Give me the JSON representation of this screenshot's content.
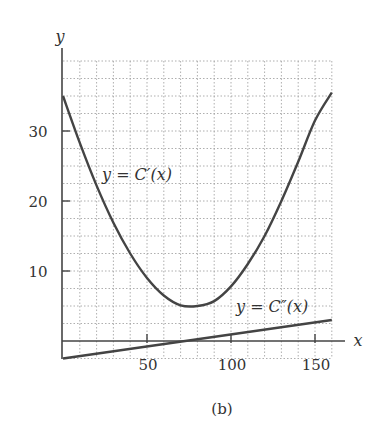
{
  "chart_data": {
    "type": "line",
    "title": "",
    "caption": "(b)",
    "xlabel": "x",
    "ylabel": "y",
    "xlim": [
      0,
      160
    ],
    "ylim": [
      -2.5,
      40
    ],
    "x_ticks": [
      50,
      100,
      150
    ],
    "y_ticks": [
      10,
      20,
      30
    ],
    "grid": {
      "on": true,
      "style": "dotted",
      "x_step": 10,
      "y_step": 2.5
    },
    "series": [
      {
        "name": "C'(x)",
        "label": "y = C′(x)",
        "x": [
          0,
          10,
          20,
          30,
          40,
          50,
          60,
          70,
          80,
          90,
          100,
          110,
          120,
          130,
          140,
          150,
          160
        ],
        "values": [
          35,
          28.3,
          22.2,
          16.9,
          12.5,
          9.0,
          6.5,
          5.1,
          5.0,
          5.7,
          7.8,
          11.0,
          15.0,
          20.0,
          25.6,
          31.5,
          35.5
        ]
      },
      {
        "name": "C''(x)",
        "label": "y = C″(x)",
        "x": [
          0,
          160
        ],
        "values": [
          -2.5,
          3.0
        ]
      }
    ],
    "annotations": [
      {
        "text": "y = C′(x)",
        "x": 35,
        "y": 24
      },
      {
        "text": "y = C″(x)",
        "x": 125,
        "y": 5
      }
    ]
  },
  "labels": {
    "x_axis": "x",
    "y_axis": "y",
    "caption": "(b)",
    "tick_x_50": "50",
    "tick_x_100": "100",
    "tick_x_150": "150",
    "tick_y_10": "10",
    "tick_y_20": "20",
    "tick_y_30": "30",
    "curve1": "y = C′(x)",
    "curve2": "y = C″(x)"
  }
}
